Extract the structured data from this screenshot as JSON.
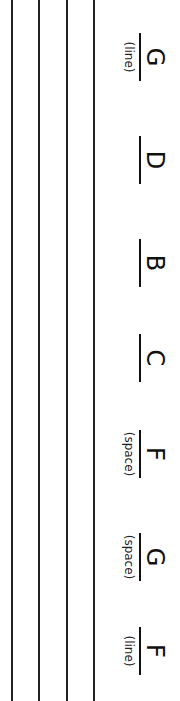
{
  "worksheet": {
    "orientation": "rotated-90-clockwise",
    "staff": {
      "visible_lines": 4
    },
    "items": [
      {
        "letter": "G",
        "hint": "(line)"
      },
      {
        "letter": "D",
        "hint": ""
      },
      {
        "letter": "B",
        "hint": ""
      },
      {
        "letter": "C",
        "hint": ""
      },
      {
        "letter": "F",
        "hint": "(space)"
      },
      {
        "letter": "G",
        "hint": "(space)"
      },
      {
        "letter": "F",
        "hint": "(line)"
      }
    ]
  }
}
